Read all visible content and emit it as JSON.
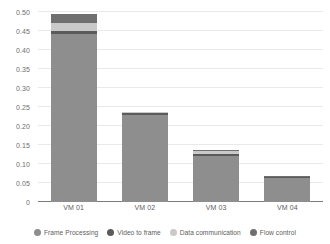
{
  "chart_data": {
    "type": "bar",
    "subtype": "stacked-bar",
    "title": "",
    "xlabel": "",
    "ylabel": "",
    "categories": [
      "VM 01",
      "VM 02",
      "VM 03",
      "VM 04"
    ],
    "series": [
      {
        "name": "Frame Processing",
        "color": "#8e8e8e",
        "values": [
          0.443,
          0.228,
          0.122,
          0.062
        ]
      },
      {
        "name": "Video to frame",
        "color": "#5b5b5b",
        "values": [
          0.007,
          0.005,
          0.004,
          0.003
        ]
      },
      {
        "name": "Data communication",
        "color": "#c9c9c9",
        "values": [
          0.021,
          0.004,
          0.007,
          0.002
        ]
      },
      {
        "name": "Flow control",
        "color": "#6f6f6f",
        "values": [
          0.024,
          0.0,
          0.004,
          0.001
        ]
      }
    ],
    "totals": [
      0.495,
      0.237,
      0.137,
      0.068
    ],
    "ylim": [
      0,
      0.5
    ],
    "yticks": [
      0,
      0.05,
      0.1,
      0.15,
      0.2,
      0.25,
      0.3,
      0.35,
      0.4,
      0.45,
      0.5
    ],
    "ytick_labels": [
      "0",
      "0.05",
      "0.10",
      "0.15",
      "0.20",
      "0.25",
      "0.30",
      "0.35",
      "0.40",
      "0.45",
      "0.50"
    ],
    "grid": true,
    "legend_position": "bottom",
    "legend": [
      "Frame Processing",
      "Video to frame",
      "Data communication",
      "Flow control"
    ],
    "colors": {
      "grid": "#e9e9e9",
      "axis": "#7d7d7d",
      "tick_text": "#6e6e6e",
      "background": "#ffffff"
    }
  }
}
